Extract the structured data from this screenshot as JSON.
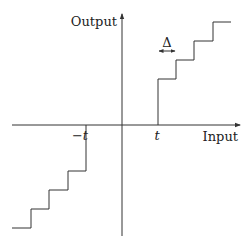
{
  "diagram": {
    "type": "quantizer-transfer-function",
    "axes": {
      "x_label": "Input",
      "y_label": "Output",
      "origin": [
        122,
        125
      ]
    },
    "labels": {
      "threshold_positive": "t",
      "threshold_negative": "−t",
      "step_width": "Δ"
    },
    "colors": {
      "line": "#333333",
      "background": "#ffffff"
    },
    "upper_staircase_points": "158,125 158,79 176,79 176,60 194,60 194,41 213,41 213,22 231,22",
    "lower_staircase_points": "86,125 86,171 68,171 68,190 49,190 49,209 31,209 31,228 12,228"
  }
}
